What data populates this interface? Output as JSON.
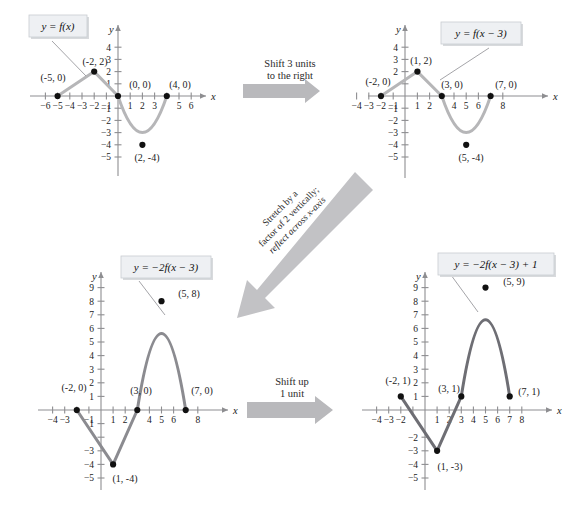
{
  "figure": {
    "background": "#ffffff",
    "curve_color_light": "#b6b6b8",
    "curve_color_dark": "#6e6e74",
    "point_color": "#111111",
    "axis_color": "#8e8e91",
    "label_box_fill": "#eef0f3",
    "arrow_color": "#b9b9bc"
  },
  "graphs": [
    {
      "id": "graph-1",
      "equation": "y = f(x)",
      "x_axis_label": "x",
      "y_axis_label": "y",
      "xlim": [
        -7,
        7
      ],
      "ylim": [
        -5.6,
        4.6
      ],
      "x_ticks": [
        -6,
        -5,
        -4,
        -3,
        -2,
        -1,
        1,
        2,
        3,
        4,
        5,
        6
      ],
      "y_ticks": [
        4,
        3,
        2,
        1,
        -1,
        -2,
        -3,
        -4,
        -5
      ],
      "points": [
        {
          "label": "(-5, 0)",
          "x": -5,
          "y": 0
        },
        {
          "label": "(-2, 2)",
          "x": -2,
          "y": 2
        },
        {
          "label": "(0, 0)",
          "x": 0,
          "y": 0
        },
        {
          "label": "(2, -4)",
          "x": 2,
          "y": -4
        },
        {
          "label": "(4, 0)",
          "x": 4,
          "y": 0
        }
      ],
      "description": "V-shaped line from (-5,0) up to (-2,2) down to (0,0), then parabola through (0,0), vertex (2,-4), up to (4,0)"
    },
    {
      "id": "graph-2",
      "equation": "y = f(x − 3)",
      "x_axis_label": "x",
      "y_axis_label": "y",
      "xlim": [
        -5,
        9
      ],
      "ylim": [
        -5.6,
        4.6
      ],
      "x_ticks": [
        -4,
        -3,
        -2,
        -1,
        1,
        2,
        3,
        4,
        5,
        6,
        7,
        8
      ],
      "y_ticks": [
        4,
        3,
        2,
        1,
        -1,
        -2,
        -3,
        -4,
        -5
      ],
      "points": [
        {
          "label": "(-2, 0)",
          "x": -2,
          "y": 0
        },
        {
          "label": "(1, 2)",
          "x": 1,
          "y": 2
        },
        {
          "label": "(3, 0)",
          "x": 3,
          "y": 0
        },
        {
          "label": "(5, -4)",
          "x": 5,
          "y": -4
        },
        {
          "label": "(7, 0)",
          "x": 7,
          "y": 0
        }
      ],
      "description": "Original graph shifted 3 units right"
    },
    {
      "id": "graph-3",
      "equation": "y = −2f(x − 3)",
      "x_axis_label": "x",
      "y_axis_label": "y",
      "xlim": [
        -5,
        9
      ],
      "ylim": [
        -5.6,
        9.8
      ],
      "x_ticks": [
        -4,
        -3,
        -2,
        -1,
        1,
        2,
        3,
        4,
        5,
        6,
        7,
        8
      ],
      "y_ticks": [
        9,
        8,
        7,
        6,
        5,
        4,
        3,
        2,
        1,
        -1,
        -2,
        -3,
        -4,
        -5
      ],
      "points": [
        {
          "label": "(-2, 0)",
          "x": -2,
          "y": 0
        },
        {
          "label": "(1, -4)",
          "x": 1,
          "y": -4
        },
        {
          "label": "(3, 0)",
          "x": 3,
          "y": 0
        },
        {
          "label": "(5, 8)",
          "x": 5,
          "y": 8
        },
        {
          "label": "(7, 0)",
          "x": 7,
          "y": 0
        }
      ],
      "description": "Shifted graph stretched vertically by factor 2 and reflected across x-axis"
    },
    {
      "id": "graph-4",
      "equation": "y = −2f(x − 3) + 1",
      "x_axis_label": "x",
      "y_axis_label": "y",
      "xlim": [
        -5,
        9
      ],
      "ylim": [
        -5.6,
        9.8
      ],
      "x_ticks": [
        -4,
        -3,
        -2,
        -1,
        1,
        2,
        3,
        4,
        5,
        6,
        7,
        8
      ],
      "y_ticks": [
        9,
        8,
        7,
        6,
        5,
        4,
        3,
        2,
        1,
        -2,
        -3,
        -4,
        -5
      ],
      "points": [
        {
          "label": "(-2, 1)",
          "x": -2,
          "y": 1
        },
        {
          "label": "(1, -3)",
          "x": 1,
          "y": -3
        },
        {
          "label": "(3, 1)",
          "x": 3,
          "y": 1
        },
        {
          "label": "(5, 9)",
          "x": 5,
          "y": 9
        },
        {
          "label": "(7, 1)",
          "x": 7,
          "y": 1
        }
      ],
      "description": "Previous graph shifted up 1 unit"
    }
  ],
  "arrows": [
    {
      "id": "arrow-shift-right",
      "line1": "Shift 3 units",
      "line2": "to the right",
      "direction": "right"
    },
    {
      "id": "arrow-stretch-reflect",
      "line1": "Stretch by a",
      "line2": "factor of 2 vertically;",
      "line3": "reflect across x-axis",
      "direction": "down-left-diagonal"
    },
    {
      "id": "arrow-shift-up",
      "line1": "Shift up",
      "line2": "1 unit",
      "direction": "right"
    }
  ]
}
